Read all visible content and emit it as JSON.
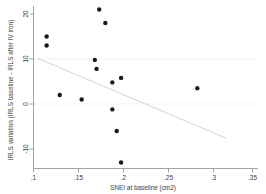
{
  "chart_data": {
    "type": "scatter",
    "title": "",
    "xlabel": "SNEI at baseline (cm2)",
    "ylabel": "IRLS variation (IRLS baseline - IRLS after IV iron)",
    "xlim": [
      0.1,
      0.35
    ],
    "ylim": [
      -15.5,
      23.0
    ],
    "xticks": [
      0.1,
      0.15,
      0.2,
      0.25,
      0.3,
      0.35
    ],
    "xticklabels": [
      ".1",
      ".15",
      ".2",
      ".25",
      ".3",
      ".35"
    ],
    "yticks": [
      -10,
      0,
      10,
      20
    ],
    "yticklabels": [
      "-10",
      "0",
      "10",
      "20"
    ],
    "grid": false,
    "legend": "none",
    "points": [
      {
        "x": 0.115,
        "y": 15.0
      },
      {
        "x": 0.115,
        "y": 13.0
      },
      {
        "x": 0.13,
        "y": 2.0
      },
      {
        "x": 0.155,
        "y": 1.0
      },
      {
        "x": 0.17,
        "y": 9.8
      },
      {
        "x": 0.172,
        "y": 7.8
      },
      {
        "x": 0.175,
        "y": 21.0
      },
      {
        "x": 0.182,
        "y": 18.0
      },
      {
        "x": 0.19,
        "y": 4.8
      },
      {
        "x": 0.19,
        "y": -1.2
      },
      {
        "x": 0.195,
        "y": -6.0
      },
      {
        "x": 0.2,
        "y": 5.8
      },
      {
        "x": 0.2,
        "y": -13.0
      },
      {
        "x": 0.287,
        "y": 3.5
      }
    ],
    "fit_line": {
      "x_start": 0.104,
      "y_start": 10.2,
      "x_end": 0.32,
      "y_end": -7.6
    }
  }
}
